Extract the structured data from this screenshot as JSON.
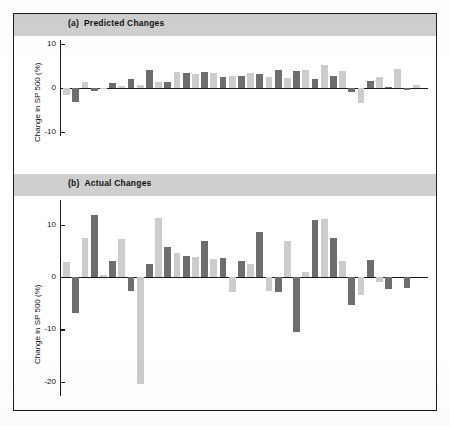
{
  "figure": {
    "background_color": "#ffffff",
    "frame_color": "#1c1c1c",
    "banner_color": "#cfcfcf",
    "series_colors": {
      "dark": "#6e6e6e",
      "light": "#cccccc"
    }
  },
  "panels": [
    {
      "tag": "(a)",
      "title": "Predicted Changes",
      "ylabel": "Change in SP 500 (%)"
    },
    {
      "tag": "(b)",
      "title": "Actual Changes",
      "ylabel": "Change in SP 500 (%)"
    }
  ],
  "chart_data": [
    {
      "type": "bar",
      "title": "(a) Predicted Changes",
      "xlabel": "",
      "ylabel": "Change in SP 500 (%)",
      "ylim": [
        -10,
        10
      ],
      "yticks": [
        10,
        0,
        -10
      ],
      "ytick_labels": [
        "10",
        "0",
        "-10"
      ],
      "grid": false,
      "legend": "none",
      "x": [
        1,
        2,
        3,
        4,
        5,
        6,
        7,
        8,
        9,
        10,
        11,
        12,
        13,
        14,
        15,
        16,
        17,
        18,
        19,
        20,
        21,
        22,
        23,
        24,
        25,
        26,
        27,
        28,
        29,
        30,
        31,
        32,
        33,
        34,
        35,
        36,
        37,
        38,
        39,
        40
      ],
      "series": [
        {
          "name": "light",
          "color": "#cccccc",
          "values": [
            -1.6,
            null,
            1.4,
            null,
            -0.2,
            null,
            0.4,
            null,
            0.6,
            null,
            1.4,
            null,
            3.6,
            null,
            3.2,
            null,
            3.5,
            null,
            2.7,
            null,
            3.3,
            null,
            2.5,
            null,
            2.2,
            null,
            4.0,
            null,
            5.2,
            null,
            3.8,
            null,
            -3.5,
            null,
            2.5,
            null,
            4.4,
            null,
            0.6,
            null
          ]
        },
        {
          "name": "dark",
          "color": "#6e6e6e",
          "values": [
            null,
            -3.2,
            null,
            -0.6,
            null,
            1.1,
            null,
            2.0,
            null,
            4.1,
            null,
            1.4,
            null,
            3.4,
            null,
            3.7,
            null,
            2.5,
            null,
            2.8,
            null,
            3.1,
            null,
            4.1,
            null,
            3.9,
            null,
            2.0,
            null,
            2.7,
            null,
            -1.0,
            null,
            1.6,
            null,
            0.3,
            null,
            -0.5
          ]
        }
      ]
    },
    {
      "type": "bar",
      "title": "(b) Actual Changes",
      "xlabel": "",
      "ylabel": "Change in SP 500 (%)",
      "ylim": [
        -22,
        14
      ],
      "yticks": [
        10,
        0,
        -10,
        -20
      ],
      "ytick_labels": [
        "10",
        "0",
        "-10",
        "-20"
      ],
      "grid": false,
      "legend": "none",
      "x": [
        1,
        2,
        3,
        4,
        5,
        6,
        7,
        8,
        9,
        10,
        11,
        12,
        13,
        14,
        15,
        16,
        17,
        18,
        19,
        20,
        21,
        22,
        23,
        24,
        25,
        26,
        27,
        28,
        29,
        30,
        31,
        32,
        33,
        34,
        35,
        36,
        37,
        38,
        39,
        40
      ],
      "series": [
        {
          "name": "light",
          "color": "#cccccc",
          "values": [
            2.8,
            null,
            7.4,
            null,
            0.4,
            null,
            7.3,
            null,
            -20.5,
            null,
            11.4,
            null,
            4.6,
            null,
            3.8,
            null,
            3.4,
            null,
            -2.9,
            null,
            2.6,
            null,
            -2.6,
            null,
            7.0,
            null,
            0.9,
            null,
            11.2,
            null,
            3.0,
            null,
            -3.4,
            null,
            -1.0,
            null
          ]
        },
        {
          "name": "dark",
          "color": "#6e6e6e",
          "values": [
            null,
            -6.8,
            null,
            11.9,
            null,
            3.1,
            null,
            -2.6,
            null,
            2.6,
            null,
            5.7,
            null,
            4.1,
            null,
            6.9,
            null,
            3.6,
            null,
            3.1,
            null,
            8.7,
            null,
            -2.9,
            null,
            -10.6,
            null,
            10.9,
            null,
            7.5,
            null,
            -5.4,
            null,
            3.2,
            null,
            -2.2,
            null,
            -2.0
          ]
        }
      ]
    }
  ]
}
